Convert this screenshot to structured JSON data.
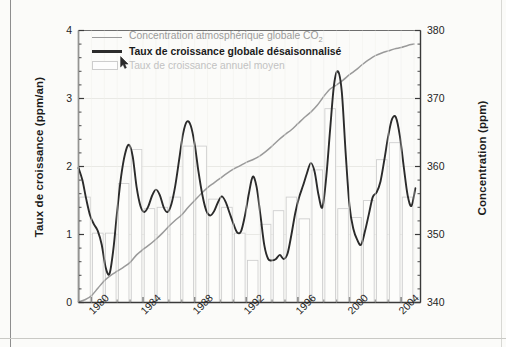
{
  "figure": {
    "background_color": "#fbfbf9",
    "plot_border_color": "#3a3a3a"
  },
  "axes": {
    "left": {
      "title": "Taux de croissance (ppm/an)",
      "ticks": [
        "0",
        "1",
        "2",
        "3",
        "4"
      ],
      "min": 0,
      "max": 4
    },
    "right": {
      "title": "Concentration (ppm)",
      "ticks": [
        "340",
        "350",
        "360",
        "370",
        "380"
      ],
      "min": 340,
      "max": 380
    },
    "bottom": {
      "ticks": [
        "1980",
        "1984",
        "1988",
        "1992",
        "1996",
        "2000",
        "2004"
      ],
      "min": 1979,
      "max": 2005.5
    }
  },
  "legend": {
    "items": [
      {
        "label": "Concentration atmosphérique globale CO",
        "subscript": "2",
        "key": "line",
        "color": "#9a9a9a"
      },
      {
        "label": "Taux de croissance globale désaisonnalisé",
        "subscript": "",
        "key": "line-dark",
        "color": "#2b2b2b"
      },
      {
        "label": "Taux de croissance annuel moyen",
        "subscript": "",
        "key": "box",
        "color": "#cdcdcd"
      }
    ]
  },
  "chart_data": {
    "type": "line",
    "title": "",
    "xlabel": "",
    "ylabel": "Taux de croissance (ppm/an)",
    "y2label": "Concentration (ppm)",
    "xlim": [
      1979,
      2005.5
    ],
    "ylim": [
      0,
      4
    ],
    "y2lim": [
      340,
      380
    ],
    "grid": true,
    "legend_position": "top-left",
    "series": [
      {
        "name": "Concentration atmosphérique globale CO2",
        "type": "line",
        "axis": "right",
        "color": "#9a9a9a",
        "unit": "ppm",
        "x": [
          1979.0,
          1979.5,
          1980.0,
          1980.5,
          1981.0,
          1981.5,
          1982.0,
          1982.5,
          1983.0,
          1983.5,
          1984.0,
          1984.5,
          1985.0,
          1985.5,
          1986.0,
          1986.5,
          1987.0,
          1987.5,
          1988.0,
          1988.5,
          1989.0,
          1989.5,
          1990.0,
          1990.5,
          1991.0,
          1991.5,
          1992.0,
          1992.5,
          1993.0,
          1993.5,
          1994.0,
          1994.5,
          1995.0,
          1995.5,
          1996.0,
          1996.5,
          1997.0,
          1997.5,
          1998.0,
          1998.5,
          1999.0,
          1999.5,
          2000.0,
          2000.5,
          2001.0,
          2001.5,
          2002.0,
          2002.5,
          2003.0,
          2003.5,
          2004.0,
          2004.5,
          2005.0
        ],
        "y": [
          340.1,
          340.4,
          341.0,
          342.1,
          343.2,
          344.0,
          344.6,
          345.2,
          345.9,
          347.0,
          347.8,
          348.5,
          349.3,
          350.2,
          351.2,
          352.1,
          352.9,
          354.0,
          355.0,
          356.0,
          356.9,
          357.6,
          358.3,
          359.0,
          359.6,
          360.1,
          360.6,
          361.0,
          361.5,
          362.2,
          363.0,
          363.9,
          364.7,
          365.4,
          366.3,
          367.2,
          368.0,
          369.0,
          370.3,
          371.4,
          372.0,
          372.7,
          373.5,
          374.2,
          375.0,
          375.7,
          376.3,
          376.7,
          377.0,
          377.3,
          377.5,
          377.8,
          378.0
        ]
      },
      {
        "name": "Taux de croissance globale désaisonnalisé",
        "type": "line",
        "axis": "left",
        "color": "#2b2b2b",
        "unit": "ppm/an",
        "x": [
          1979.0,
          1979.3,
          1979.6,
          1979.9,
          1980.2,
          1980.5,
          1980.8,
          1981.1,
          1981.4,
          1981.7,
          1982.0,
          1982.3,
          1982.6,
          1982.9,
          1983.2,
          1983.5,
          1983.8,
          1984.1,
          1984.4,
          1984.7,
          1985.0,
          1985.3,
          1985.6,
          1985.9,
          1986.2,
          1986.5,
          1986.8,
          1987.1,
          1987.4,
          1987.7,
          1988.0,
          1988.3,
          1988.6,
          1988.9,
          1989.2,
          1989.5,
          1989.8,
          1990.1,
          1990.4,
          1990.7,
          1991.0,
          1991.3,
          1991.6,
          1991.9,
          1992.2,
          1992.5,
          1992.8,
          1993.1,
          1993.4,
          1993.7,
          1994.0,
          1994.3,
          1994.6,
          1994.9,
          1995.2,
          1995.5,
          1995.8,
          1996.1,
          1996.4,
          1996.7,
          1997.0,
          1997.3,
          1997.6,
          1997.9,
          1998.2,
          1998.5,
          1998.8,
          1999.1,
          1999.4,
          1999.7,
          2000.0,
          2000.3,
          2000.6,
          2000.9,
          2001.2,
          2001.5,
          2001.8,
          2002.1,
          2002.4,
          2002.7,
          2003.0,
          2003.3,
          2003.6,
          2003.9,
          2004.2,
          2004.5,
          2004.8,
          2005.1
        ],
        "y": [
          1.98,
          1.8,
          1.52,
          1.28,
          1.15,
          1.05,
          0.85,
          0.52,
          0.42,
          0.78,
          1.35,
          1.85,
          2.18,
          2.32,
          2.15,
          1.7,
          1.42,
          1.33,
          1.41,
          1.57,
          1.66,
          1.58,
          1.4,
          1.33,
          1.45,
          1.72,
          2.1,
          2.48,
          2.66,
          2.6,
          2.33,
          1.92,
          1.58,
          1.35,
          1.28,
          1.34,
          1.47,
          1.56,
          1.48,
          1.32,
          1.16,
          1.03,
          1.05,
          1.28,
          1.6,
          1.85,
          1.7,
          1.28,
          0.84,
          0.64,
          0.62,
          0.64,
          0.7,
          0.64,
          0.72,
          1.0,
          1.32,
          1.55,
          1.72,
          1.9,
          2.05,
          1.92,
          1.58,
          1.4,
          1.85,
          2.55,
          3.2,
          3.4,
          3.1,
          2.2,
          1.42,
          1.08,
          0.92,
          0.85,
          1.05,
          1.3,
          1.55,
          1.62,
          1.78,
          2.1,
          2.45,
          2.7,
          2.72,
          2.45,
          2.0,
          1.58,
          1.42,
          1.68
        ],
        "peaks": [
          {
            "year": 1998.8,
            "value": 3.4
          },
          {
            "year": 1987.4,
            "value": 2.66
          },
          {
            "year": 2003.4,
            "value": 2.72
          },
          {
            "year": 1982.9,
            "value": 2.32
          }
        ],
        "troughs": [
          {
            "year": 1981.4,
            "value": 0.42
          },
          {
            "year": 1994.0,
            "value": 0.62
          },
          {
            "year": 2000.9,
            "value": 0.85
          }
        ]
      },
      {
        "name": "Taux de croissance annuel moyen",
        "type": "bar",
        "axis": "left",
        "color": "#cdcdcd",
        "unit": "ppm/an",
        "categories": [
          1979,
          1980,
          1981,
          1982,
          1983,
          1984,
          1985,
          1986,
          1987,
          1988,
          1989,
          1990,
          1991,
          1992,
          1993,
          1994,
          1995,
          1996,
          1997,
          1998,
          1999,
          2000,
          2001,
          2002,
          2003,
          2004
        ],
        "values": [
          1.55,
          1.02,
          1.02,
          1.75,
          2.25,
          1.38,
          1.4,
          1.55,
          2.3,
          2.3,
          1.52,
          1.4,
          1.02,
          0.62,
          1.15,
          1.35,
          1.55,
          1.23,
          1.95,
          2.85,
          1.38,
          1.25,
          1.5,
          2.1,
          2.35,
          1.55
        ]
      }
    ]
  }
}
